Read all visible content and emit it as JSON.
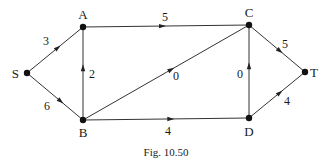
{
  "diagram": {
    "type": "directed-network",
    "nodes": [
      {
        "id": "S",
        "label": "S"
      },
      {
        "id": "A",
        "label": "A"
      },
      {
        "id": "B",
        "label": "B"
      },
      {
        "id": "C",
        "label": "C"
      },
      {
        "id": "D",
        "label": "D"
      },
      {
        "id": "T",
        "label": "T"
      }
    ],
    "edges": [
      {
        "from": "S",
        "to": "A",
        "weight": "3"
      },
      {
        "from": "S",
        "to": "B",
        "weight": "6"
      },
      {
        "from": "B",
        "to": "A",
        "weight": "2"
      },
      {
        "from": "A",
        "to": "C",
        "weight": "5"
      },
      {
        "from": "B",
        "to": "C",
        "weight": "0"
      },
      {
        "from": "B",
        "to": "D",
        "weight": "4"
      },
      {
        "from": "D",
        "to": "C",
        "weight": "0"
      },
      {
        "from": "C",
        "to": "T",
        "weight": "5"
      },
      {
        "from": "D",
        "to": "T",
        "weight": "4"
      }
    ]
  },
  "caption": "Fig. 10.50"
}
